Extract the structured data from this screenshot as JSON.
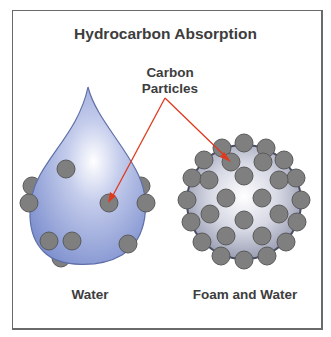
{
  "diagram": {
    "title": "Hydrocarbon Absorption",
    "callout": {
      "line1": "Carbon",
      "line2": "Particles"
    },
    "labels": {
      "water": "Water",
      "foam": "Foam and Water"
    },
    "colors": {
      "text": "#3d3d3d",
      "drop_fill": "#8e9fd6",
      "drop_highlight": "#ffffff",
      "drop_outline": "#5f6fa8",
      "sphere_fill": "#b9bccd",
      "sphere_outline": "#4b4e63",
      "particle_fill": "#7f7f7f",
      "particle_outline": "#5a5a5a",
      "arrow": "#e03a1e",
      "frame": "#6a6a6a"
    },
    "nodes": [
      {
        "id": "water-drop",
        "label": "Water",
        "shape": "teardrop",
        "particles": 10
      },
      {
        "id": "foam-sphere",
        "label": "Foam and Water",
        "shape": "sphere",
        "particles": 34
      }
    ],
    "arrows": [
      {
        "from": "callout",
        "to": "water-drop particle",
        "color": "#e03a1e"
      },
      {
        "from": "callout",
        "to": "foam-sphere particle",
        "color": "#e03a1e"
      }
    ]
  }
}
